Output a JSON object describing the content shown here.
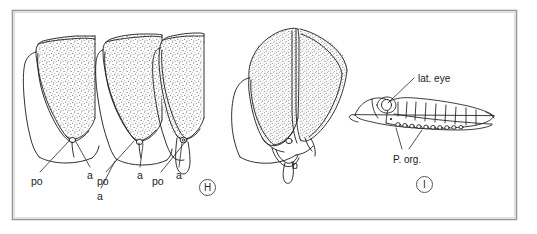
{
  "figure": {
    "background_color": "#ffffff",
    "frame_color": "#999999",
    "ink_color": "#1a1a1a",
    "stipple_color": "#4a4a4a"
  },
  "panels": [
    {
      "tag": "H",
      "description": "Three stippled scale/valve specimens in lateral view",
      "labels": [
        {
          "text": "po",
          "x": 31,
          "y": 176
        },
        {
          "text": "a",
          "x": 87,
          "y": 170
        },
        {
          "text": "po",
          "x": 97,
          "y": 176
        },
        {
          "text": "a",
          "x": 137,
          "y": 170
        },
        {
          "text": "po",
          "x": 152,
          "y": 176
        },
        {
          "text": "a",
          "x": 176,
          "y": 170
        },
        {
          "text": "a",
          "x": 97,
          "y": 191
        }
      ]
    },
    {
      "tag": "H",
      "description": "Paired stippled valves, specimen b",
      "labels": [
        {
          "text": "b",
          "x": 292,
          "y": 160
        }
      ]
    },
    {
      "tag": "I",
      "description": "Whole organism in lateral view showing lateral eye and photophore organs",
      "labels": [
        {
          "text": "lat. eye",
          "x": 418,
          "y": 74
        },
        {
          "text": "P. org.",
          "x": 393,
          "y": 155
        }
      ]
    }
  ],
  "panel_tags": [
    {
      "letter": "H",
      "x": 199,
      "y": 179
    },
    {
      "letter": "I",
      "x": 416,
      "y": 176
    }
  ],
  "frame": {
    "x": 12,
    "y": 10,
    "width": 505,
    "height": 210
  }
}
